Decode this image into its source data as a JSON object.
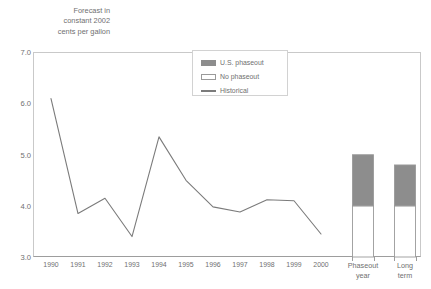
{
  "chart_data": {
    "type": "line",
    "title": "Forecast in\nconstant 2002\ncents per gallon",
    "xlabel": "",
    "ylabel": "Forecast in constant 2002 cents per gallon",
    "ylim": [
      3.0,
      7.0
    ],
    "yticks": [
      "3.0",
      "4.0",
      "5.0",
      "6.0",
      "7.0"
    ],
    "ytick_values": [
      3.0,
      4.0,
      5.0,
      6.0,
      7.0
    ],
    "grid": false,
    "legend_position": "top-center",
    "categories": [
      "1990",
      "1991",
      "1992",
      "1993",
      "1994",
      "1995",
      "1996",
      "1997",
      "1998",
      "1999",
      "2000"
    ],
    "series": [
      {
        "name": "Historical",
        "type": "line",
        "values": [
          6.1,
          3.85,
          4.15,
          3.4,
          5.35,
          4.5,
          3.98,
          3.88,
          4.12,
          4.1,
          3.45
        ]
      }
    ],
    "bar_categories": [
      "Phaseout\nyear",
      "Long\nterm"
    ],
    "bar_series": [
      {
        "name": "No phaseout",
        "type": "stacked-bar",
        "values": [
          4.0,
          4.0
        ]
      },
      {
        "name": "U.S. phaseout",
        "type": "stacked-bar",
        "values": [
          1.0,
          0.8
        ]
      }
    ],
    "bar_totals": [
      5.0,
      4.8
    ],
    "legend": [
      {
        "label": "U.S. phaseout",
        "swatch": "filled",
        "color": "#8d8d8d"
      },
      {
        "label": "No phaseout",
        "swatch": "open",
        "color": "#ffffff"
      },
      {
        "label": "Historical",
        "swatch": "line",
        "color": "#7b7b7b"
      }
    ],
    "colors": {
      "line": "#7b7b7b",
      "bar_filled": "#8d8d8d",
      "bar_open": "#ffffff",
      "bar_border": "#9a9a9a",
      "axis": "#9d9d9d",
      "frame": "#c9c9c9",
      "text": "#6f6f6f"
    }
  }
}
